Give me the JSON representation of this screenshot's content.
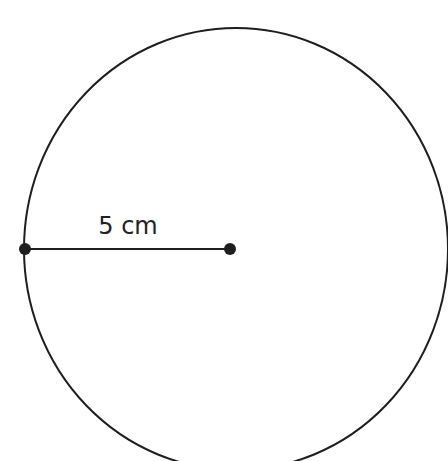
{
  "diagram": {
    "type": "circle-radius",
    "radius_label": "5 cm",
    "colors": {
      "stroke": "#1e1e1e",
      "background": "#ffffff"
    }
  }
}
